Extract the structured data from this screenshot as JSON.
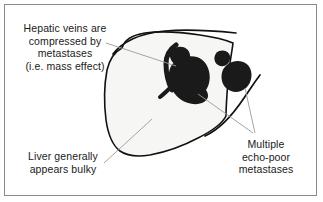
{
  "figure": {
    "background_color": "#ffffff",
    "frame_color": "#8a8a8a",
    "liver_fill_color": "#f6f6f4",
    "liver_outline_color": "#111111",
    "lesion_color": "#1a1a1a",
    "leader_line_color": "#9a9a9a",
    "text_color": "#1a1a1a"
  },
  "labels": {
    "hepatic_veins": {
      "lines": [
        "Hepatic veins are",
        "compressed by",
        "metastases",
        "(i.e. mass effect)"
      ]
    },
    "liver_bulky": {
      "lines": [
        "Liver generally",
        "appears bulky"
      ]
    },
    "metastases": {
      "lines": [
        "Multiple",
        "echo-poor",
        "metastases"
      ]
    }
  },
  "structures": [
    {
      "name": "liver-outline",
      "description": "Bulky rounded liver contour"
    },
    {
      "name": "hepatic-vein",
      "description": "Compressed hepatic vein crossing the large metastasis"
    },
    {
      "name": "metastasis-large-central",
      "description": "Large echo-poor metastasis"
    },
    {
      "name": "metastasis-small-upper",
      "description": "Small echo-poor metastasis above the large one"
    },
    {
      "name": "metastasis-small-right",
      "description": "Small echo-poor metastasis on the right"
    },
    {
      "name": "metastasis-large-right",
      "description": "Right-sided echo-poor metastasis"
    }
  ]
}
